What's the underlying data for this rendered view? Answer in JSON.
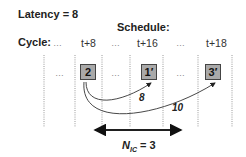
{
  "latency_label": "Latency = 8",
  "schedule_label": "Schedule:",
  "cycle_label": "Cycle:",
  "cycles": [
    "…",
    "t+8",
    "…",
    "t+16",
    "…",
    "t+18"
  ],
  "row_cells": [
    "…",
    "2",
    "…",
    "1′",
    "…",
    "3′"
  ],
  "edges": [
    {
      "from": "2",
      "to": "1′",
      "label": "8"
    },
    {
      "from": "2",
      "to": "3′",
      "label": "10"
    }
  ],
  "span_label_main": "N",
  "span_label_sub": "IC",
  "span_label_rest": " = 3"
}
